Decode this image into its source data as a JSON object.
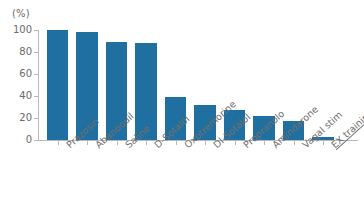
{
  "chart_data": {
    "type": "bar",
    "title": "",
    "subtitle": "",
    "xlabel": "",
    "ylabel": "(%)",
    "ylim": [
      0,
      100
    ],
    "yticks": [
      0,
      20,
      40,
      60,
      80,
      100
    ],
    "grid": false,
    "legend": null,
    "bar_color": "#1f6fa0",
    "categories": [
      "Prazosin",
      "Abanoquil",
      "Saline",
      "D-Sotalol",
      "Oxotremorine",
      "Dl-Sotalol",
      "Propranolo",
      "Amindarone",
      "Vagal stim",
      "EX training"
    ],
    "values": [
      100,
      98,
      89,
      88,
      39,
      32,
      27,
      22,
      17,
      3
    ],
    "annotations": [
      {
        "target": "EX training",
        "style": "underline"
      }
    ]
  },
  "axis": {
    "unit_label": "(%)",
    "tick_labels": [
      "100",
      "80",
      "60",
      "40",
      "20",
      "0"
    ]
  }
}
